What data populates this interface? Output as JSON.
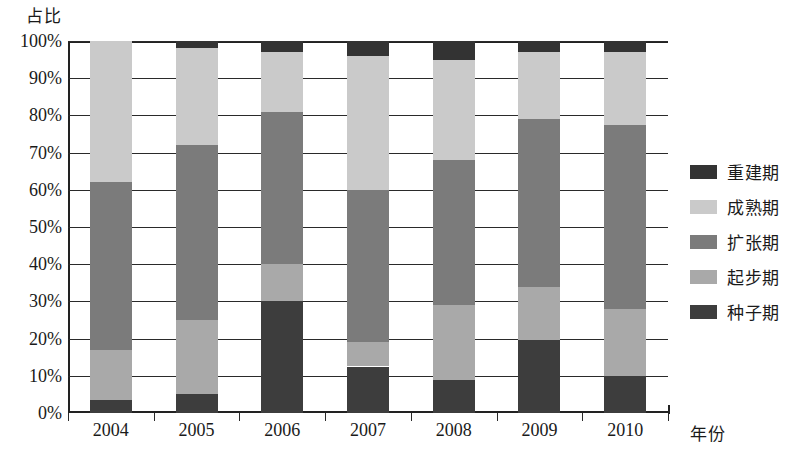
{
  "chart_data": {
    "type": "bar",
    "stacked": true,
    "normalized": true,
    "title": "",
    "xlabel": "年份",
    "ylabel": "占比",
    "categories": [
      "2004",
      "2005",
      "2006",
      "2007",
      "2008",
      "2009",
      "2010"
    ],
    "ytick_labels": [
      "0%",
      "10%",
      "20%",
      "30%",
      "40%",
      "50%",
      "60%",
      "70%",
      "80%",
      "90%",
      "100%"
    ],
    "ytick_values": [
      0,
      10,
      20,
      30,
      40,
      50,
      60,
      70,
      80,
      90,
      100
    ],
    "ylim": [
      0,
      100
    ],
    "grid": true,
    "legend_position": "right",
    "series": [
      {
        "name": "种子期",
        "color": "#3d3d3d",
        "values": [
          3.5,
          5.0,
          30.0,
          12.5,
          9.0,
          19.5,
          10.0
        ]
      },
      {
        "name": "起步期",
        "color": "#a9a9a9",
        "values": [
          13.5,
          20.0,
          10.0,
          6.5,
          20.0,
          14.5,
          18.0
        ]
      },
      {
        "name": "扩张期",
        "color": "#7b7b7b",
        "values": [
          45.0,
          47.0,
          41.0,
          41.0,
          39.0,
          45.0,
          49.5
        ]
      },
      {
        "name": "成熟期",
        "color": "#cacaca",
        "values": [
          38.0,
          26.0,
          16.0,
          36.0,
          27.0,
          18.0,
          19.5
        ]
      },
      {
        "name": "重建期",
        "color": "#333333",
        "values": [
          0.0,
          2.0,
          3.0,
          4.0,
          5.0,
          3.0,
          3.0
        ]
      }
    ]
  },
  "legend": {
    "items": [
      {
        "label": "重建期",
        "color": "#333333"
      },
      {
        "label": "成熟期",
        "color": "#cacaca"
      },
      {
        "label": "扩张期",
        "color": "#7b7b7b"
      },
      {
        "label": "起步期",
        "color": "#a9a9a9"
      },
      {
        "label": "种子期",
        "color": "#3d3d3d"
      }
    ]
  }
}
